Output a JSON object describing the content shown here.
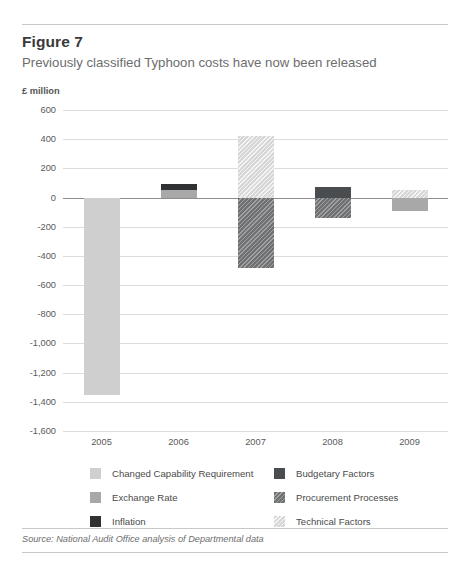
{
  "figure": {
    "title": "Figure 7",
    "subtitle": "Previously classified Typhoon costs have now been released",
    "unit_label": "£ million",
    "source": "Source: National Audit Office analysis of Departmental data"
  },
  "legend": {
    "left": [
      {
        "label": "Changed Capability Requirement",
        "key": "changed",
        "color": "#cfcfcf"
      },
      {
        "label": "Exchange Rate",
        "key": "exchange",
        "color": "#a8a8a8"
      },
      {
        "label": "Inflation",
        "key": "inflation",
        "color": "#2f3133"
      }
    ],
    "right": [
      {
        "label": "Budgetary Factors",
        "key": "budget",
        "color": "#4a4d50"
      },
      {
        "label": "Procurement Processes",
        "key": "procure",
        "color": "#6f7173"
      },
      {
        "label": "Technical Factors",
        "key": "technical",
        "color": "#d7d7d7"
      }
    ]
  },
  "chart_data": {
    "type": "bar",
    "title": "Previously classified Typhoon costs have now been released",
    "subtitle": "Figure 7",
    "xlabel": "",
    "ylabel": "£ million",
    "ylim": [
      -1600,
      600
    ],
    "ytick_step": 200,
    "yticks": [
      600,
      400,
      200,
      0,
      -200,
      -400,
      -600,
      -800,
      -1000,
      -1200,
      -1400,
      -1600
    ],
    "ytick_labels": [
      "600",
      "400",
      "200",
      "0",
      "-200",
      "-400",
      "-600",
      "-800",
      "-1,000",
      "-1,200",
      "-1,400",
      "-1,600"
    ],
    "categories": [
      "2005",
      "2006",
      "2007",
      "2008",
      "2009"
    ],
    "grid": true,
    "legend_position": "bottom",
    "stacked": true,
    "series": [
      {
        "name": "Changed Capability Requirement",
        "key": "changed",
        "values": [
          -1350,
          0,
          0,
          0,
          0
        ]
      },
      {
        "name": "Exchange Rate",
        "key": "exchange",
        "values": [
          0,
          55,
          0,
          0,
          -95
        ]
      },
      {
        "name": "Inflation",
        "key": "inflation",
        "values": [
          0,
          40,
          0,
          0,
          0
        ]
      },
      {
        "name": "Budgetary Factors",
        "key": "budget",
        "values": [
          0,
          0,
          0,
          70,
          0
        ]
      },
      {
        "name": "Procurement Processes",
        "key": "procure",
        "values": [
          0,
          0,
          -480,
          -140,
          0
        ]
      },
      {
        "name": "Technical Factors",
        "key": "technical",
        "values": [
          0,
          0,
          420,
          0,
          55
        ]
      }
    ],
    "bars": [
      {
        "category": "2005",
        "segments": [
          {
            "key": "changed",
            "label": "Changed Capability Requirement",
            "from": 0,
            "to": -1350
          }
        ]
      },
      {
        "category": "2006",
        "segments": [
          {
            "key": "inflation",
            "label": "Inflation",
            "from": 95,
            "to": 55
          },
          {
            "key": "exchange",
            "label": "Exchange Rate",
            "from": 55,
            "to": 0
          }
        ]
      },
      {
        "category": "2007",
        "segments": [
          {
            "key": "technical",
            "label": "Technical Factors",
            "from": 420,
            "to": 0
          },
          {
            "key": "procure",
            "label": "Procurement Processes",
            "from": 0,
            "to": -480
          }
        ]
      },
      {
        "category": "2008",
        "segments": [
          {
            "key": "budget",
            "label": "Budgetary Factors",
            "from": 70,
            "to": 0
          },
          {
            "key": "procure",
            "label": "Procurement Processes",
            "from": 0,
            "to": -140
          }
        ]
      },
      {
        "category": "2009",
        "segments": [
          {
            "key": "technical",
            "label": "Technical Factors",
            "from": 55,
            "to": 0
          },
          {
            "key": "exchange",
            "label": "Exchange Rate",
            "from": 0,
            "to": -95
          }
        ]
      }
    ]
  }
}
